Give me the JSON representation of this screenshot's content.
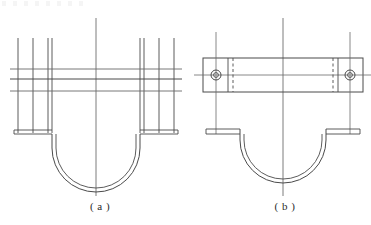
{
  "sheet": {
    "background_color": "#ffffff",
    "line_color": "#3a3a3a",
    "thin_line_color": "#6e6e6e",
    "centerline_color": "#555555",
    "width": 371,
    "height": 225
  },
  "figures": [
    {
      "id": "figure-a",
      "caption": "( a )",
      "title": "U-shaped pipe clamp front view",
      "description": "Symmetric U-bend strap with four vertical element lines per side, three horizontal section lines, bottom flanges and a vertical centerline.",
      "geometry": {
        "centerline_x": 96,
        "centerline_top_y": 18,
        "centerline_bottom_y": 196,
        "vertical_lines_left_x": [
          18,
          33,
          48,
          52
        ],
        "vertical_lines_right_x": [
          140,
          144,
          159,
          174
        ],
        "vertical_lines_top_y": 38,
        "vertical_lines_bottom_y": 133,
        "horizontal_lines_y": [
          69,
          79,
          91
        ],
        "horizontal_left_x": 10,
        "horizontal_right_x": 182,
        "flange_y_top": 130,
        "flange_y_bottom": 134,
        "flange_left_outer_x": 14,
        "flange_left_inner_x": 52,
        "flange_right_inner_x": 140,
        "flange_right_outer_x": 178,
        "u_outer_radius": 44,
        "u_inner_radius": 40,
        "u_center_y": 148
      }
    },
    {
      "id": "figure-b",
      "caption": "( b )",
      "title": "Pipe clamp with bolted cover bar",
      "description": "Flat cover bar with two bolt holes above a semicircular saddle with flat mounting ears.",
      "geometry": {
        "centerline_x": 283,
        "centerline_top_y": 18,
        "centerline_bottom_y": 196,
        "bar_left_x": 203,
        "bar_right_x": 363,
        "bar_top_y": 58,
        "bar_bottom_y": 92,
        "bar_centerline_y": 75,
        "bar_centerline_left_x": 194,
        "bar_centerline_right_x": 372,
        "hole_left_cx": 216,
        "hole_right_cx": 350,
        "hole_cy": 75,
        "hole_outer_r": 5,
        "hole_inner_r": 3,
        "solid_divider_left_x": 228,
        "solid_divider_right_x": 338,
        "dashed_divider_left_x": 233,
        "dashed_divider_right_x": 333,
        "bolt_axis_left_x": 216,
        "bolt_axis_right_x": 350,
        "bolt_axis_top_y": 32,
        "bolt_axis_bottom_y": 134,
        "ear_y_top": 129,
        "ear_y_bottom": 134,
        "ear_left_outer_x": 206,
        "ear_left_inner_x": 240,
        "ear_right_inner_x": 326,
        "ear_right_outer_x": 360,
        "saddle_outer_radius": 48,
        "saddle_inner_radius": 44,
        "saddle_center_y": 140
      }
    }
  ],
  "annotations": {
    "hidden_line_style": "dashed",
    "centerline_style": "thin continuous",
    "visible_line_style": "continuous"
  }
}
